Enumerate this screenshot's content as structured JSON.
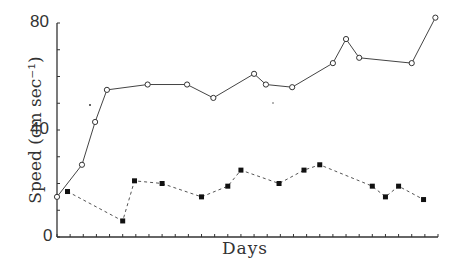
{
  "chart_data": {
    "type": "line",
    "title": "",
    "xlabel": "Days",
    "ylabel": "Speed (cm sec⁻¹)",
    "ylim": [
      0,
      80
    ],
    "xlim": [
      0,
      29
    ],
    "yticks_labeled": [
      "0",
      "40",
      "80"
    ],
    "ytick_step_minor": 10,
    "xtick_count": 29,
    "grid": false,
    "legend": null,
    "series": [
      {
        "name": "open circles (solid line)",
        "marker": "open-circle",
        "line": "solid",
        "x": [
          0,
          1.9,
          2.9,
          3.8,
          6.9,
          9.9,
          11.9,
          15,
          15.9,
          17.9,
          21,
          22,
          23,
          27,
          28.8
        ],
        "values": [
          15,
          27,
          43,
          55,
          57,
          57,
          52,
          61,
          57,
          56,
          65,
          74,
          67,
          65,
          82
        ]
      },
      {
        "name": "filled squares (dashed line)",
        "marker": "filled-square",
        "line": "dashed",
        "x": [
          0.8,
          5,
          5.9,
          8,
          11,
          13,
          14,
          16.9,
          18.8,
          20,
          24,
          25,
          26,
          27.9
        ],
        "values": [
          17,
          6,
          21,
          20,
          15,
          19,
          25,
          20,
          25,
          27,
          19,
          15,
          19,
          14
        ]
      }
    ]
  },
  "labels": {
    "xlabel": "Days",
    "ylabel": "Speed (cm sec⁻¹)",
    "y0": "0",
    "y40": "40",
    "y80": "80"
  }
}
